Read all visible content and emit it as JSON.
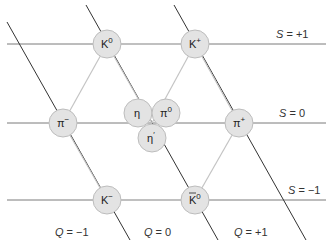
{
  "diagram": {
    "colors": {
      "strangeness_line": "#7a7a7a",
      "charge_line": "#333333",
      "hexagon_edge": "#b8b8b8",
      "particle_fill": "#e3e3e3",
      "particle_stroke": "#bdbdbd",
      "text": "#222222"
    },
    "particles": [
      {
        "name": "K0",
        "label": "K",
        "sup": "0",
        "bar": false
      },
      {
        "name": "K+",
        "label": "K",
        "sup": "+",
        "bar": false
      },
      {
        "name": "pi-",
        "label": "π",
        "sup": "−",
        "bar": false
      },
      {
        "name": "pi+",
        "label": "π",
        "sup": "+",
        "bar": false
      },
      {
        "name": "eta",
        "label": "η",
        "sup": "",
        "bar": false
      },
      {
        "name": "pi0",
        "label": "π",
        "sup": "0",
        "bar": false
      },
      {
        "name": "eta-prime",
        "label": "η",
        "sup": "′",
        "bar": false
      },
      {
        "name": "K-",
        "label": "K",
        "sup": "−",
        "bar": false
      },
      {
        "name": "K0-bar",
        "label": "K",
        "sup": "0",
        "bar": true
      }
    ],
    "strangeness_labels": [
      {
        "var": "S",
        "text": " = +1"
      },
      {
        "var": "S",
        "text": " = 0"
      },
      {
        "var": "S",
        "text": " = −1"
      }
    ],
    "charge_labels": [
      {
        "var": "Q",
        "text": " = −1"
      },
      {
        "var": "Q",
        "text": " = 0"
      },
      {
        "var": "Q",
        "text": " = +1"
      }
    ]
  }
}
